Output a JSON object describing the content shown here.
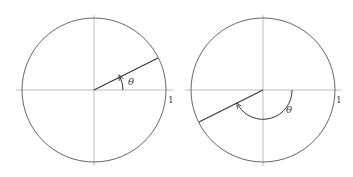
{
  "diagrams": [
    {
      "id": "left",
      "angle_label": "θ",
      "unit_label": "1",
      "angle_deg": 27,
      "description": "Unit circle with ray at acute angle θ measured counterclockwise from positive x-axis"
    },
    {
      "id": "right",
      "angle_label": "θ",
      "unit_label": "1",
      "angle_deg": 207,
      "description": "Unit circle with ray in third quadrant, angle θ shown by arc sweeping below the x-axis"
    }
  ],
  "colors": {
    "axis": "#aaaaaa",
    "circle": "#666666",
    "ray": "#333333"
  }
}
